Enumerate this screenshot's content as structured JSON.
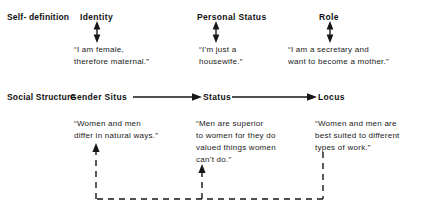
{
  "figure": {
    "rows": [
      {
        "key": "self-definition",
        "label": "Self-\ndefinition"
      },
      {
        "key": "social-structure",
        "label": "Social\nStructure"
      }
    ],
    "self_definition": {
      "nodes": [
        {
          "key": "identity",
          "title": "Identity",
          "quote": "“I am female,\ntherefore maternal.”"
        },
        {
          "key": "personal-status",
          "title": "Personal  Status",
          "quote": "“I’m just a\nhousewife.”"
        },
        {
          "key": "role",
          "title": "Role",
          "quote": "“I am a secretary and\nwant to become a mother.”"
        }
      ]
    },
    "social_structure": {
      "nodes": [
        {
          "key": "gender-situs",
          "title": "Gender  Situs",
          "quote": "“Women and men\ndiffer in natural ways.”"
        },
        {
          "key": "status",
          "title": "Status",
          "quote": "“Men are superior\nto women for they do\nvalued things women\ncan’t do.”"
        },
        {
          "key": "locus",
          "title": "Locus",
          "quote": "“Women and men are\nbest suited to different\ntypes of work.”"
        }
      ]
    },
    "connectors": {
      "vertical_double_arrows": [
        {
          "key": "identity-link",
          "style": "solid",
          "heads": "both"
        },
        {
          "key": "personal-status-link",
          "style": "solid",
          "heads": "both"
        },
        {
          "key": "role-link",
          "style": "solid",
          "heads": "both"
        }
      ],
      "horizontal_arrows": [
        {
          "key": "gender-situs-to-status",
          "style": "solid",
          "heads": "end"
        },
        {
          "key": "status-to-locus",
          "style": "solid",
          "heads": "end"
        }
      ],
      "feedback_loop": {
        "key": "locus-feedback-loop",
        "style": "dashed",
        "from": "locus",
        "to": [
          "gender-situs",
          "status"
        ],
        "heads": "both-branches-up"
      }
    },
    "colors": {
      "ink": "#161616",
      "background": "#ffffff"
    }
  }
}
